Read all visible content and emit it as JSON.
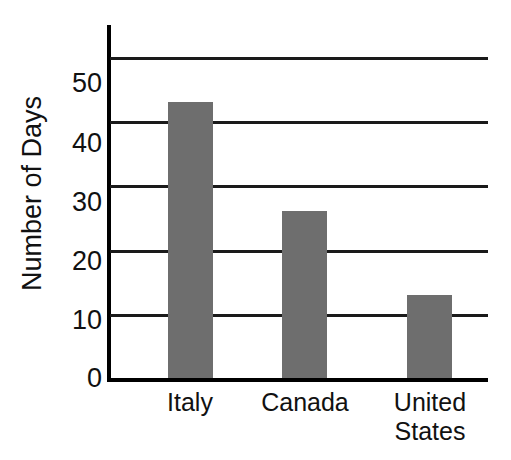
{
  "chart_data": {
    "type": "bar",
    "title": "Number of Days of Vacation",
    "xlabel": "",
    "ylabel": "Number of Days",
    "categories": [
      "Italy",
      "Canada",
      "United States"
    ],
    "category_lines": [
      [
        "Italy"
      ],
      [
        "Canada"
      ],
      [
        "United",
        "States"
      ]
    ],
    "values": [
      43,
      26,
      13
    ],
    "ylim": [
      0,
      55
    ],
    "y_ticks": [
      0,
      10,
      20,
      30,
      40,
      50
    ],
    "y_tick_labels": [
      "0",
      "10",
      "20",
      "30",
      "40",
      "50"
    ],
    "grid": true,
    "grid_axis": "y",
    "legend": false,
    "bar_color": "#6e6e6e",
    "axis_color": "#000000",
    "gridline_color": "#1a1a1a",
    "background": "#ffffff"
  }
}
